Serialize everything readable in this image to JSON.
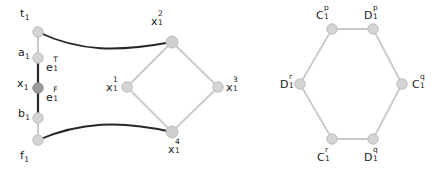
{
  "figure": {
    "background": "#ffffff",
    "node_fill": "#d4d4d4",
    "node_fill_dark": "#9a9a9a",
    "node_stroke": "#b8b8b8",
    "edge_light": "#c9c9c9",
    "edge_dark": "#262626",
    "text_color": "#1a1a1a"
  },
  "variable_gadget": {
    "name": "variable-gadget",
    "nodes": [
      {
        "id": "t1",
        "label_base": "t",
        "label_sub": "1",
        "label_sup": "",
        "x": 38,
        "y": 32,
        "shade": "light"
      },
      {
        "id": "a1",
        "label_base": "a",
        "label_sub": "1",
        "label_sup": "",
        "x": 38,
        "y": 58,
        "shade": "light"
      },
      {
        "id": "x1",
        "label_base": "x",
        "label_sub": "1",
        "label_sup": "",
        "x": 38,
        "y": 88,
        "shade": "dark"
      },
      {
        "id": "b1",
        "label_base": "b",
        "label_sub": "1",
        "label_sup": "",
        "x": 38,
        "y": 118,
        "shade": "light"
      },
      {
        "id": "f1",
        "label_base": "f",
        "label_sub": "1",
        "label_sup": "",
        "x": 38,
        "y": 140,
        "shade": "light"
      },
      {
        "id": "x1_1",
        "label_base": "x",
        "label_sub": "1",
        "label_sup": "1",
        "x": 127,
        "y": 87,
        "shade": "light"
      },
      {
        "id": "x1_2",
        "label_base": "x",
        "label_sub": "1",
        "label_sup": "2",
        "x": 172,
        "y": 42,
        "shade": "light"
      },
      {
        "id": "x1_3",
        "label_base": "x",
        "label_sub": "1",
        "label_sup": "3",
        "x": 218,
        "y": 87,
        "shade": "light"
      },
      {
        "id": "x1_4",
        "label_base": "x",
        "label_sub": "1",
        "label_sup": "4",
        "x": 172,
        "y": 132,
        "shade": "light"
      }
    ],
    "edge_labels": [
      {
        "id": "e1T",
        "label_base": "e",
        "label_sub": "1",
        "label_sup": "T",
        "x": 46,
        "y": 66
      },
      {
        "id": "e1F",
        "label_base": "e",
        "label_sub": "1",
        "label_sup": "F",
        "x": 46,
        "y": 96
      }
    ]
  },
  "clause_gadget": {
    "name": "clause-hexagon-gadget",
    "nodes": [
      {
        "id": "C1p",
        "label_base": "C",
        "label_sub": "1",
        "label_sup": "p",
        "x": 332,
        "y": 29
      },
      {
        "id": "D1p",
        "label_base": "D",
        "label_sub": "1",
        "label_sup": "p",
        "x": 373,
        "y": 29
      },
      {
        "id": "C1q",
        "label_base": "C",
        "label_sub": "1",
        "label_sup": "q",
        "x": 402,
        "y": 84
      },
      {
        "id": "D1q",
        "label_base": "D",
        "label_sub": "1",
        "label_sup": "q",
        "x": 373,
        "y": 139
      },
      {
        "id": "C1r",
        "label_base": "C",
        "label_sub": "1",
        "label_sup": "r",
        "x": 332,
        "y": 139
      },
      {
        "id": "D1r",
        "label_base": "D",
        "label_sub": "1",
        "label_sup": "r",
        "x": 300,
        "y": 84
      }
    ]
  }
}
